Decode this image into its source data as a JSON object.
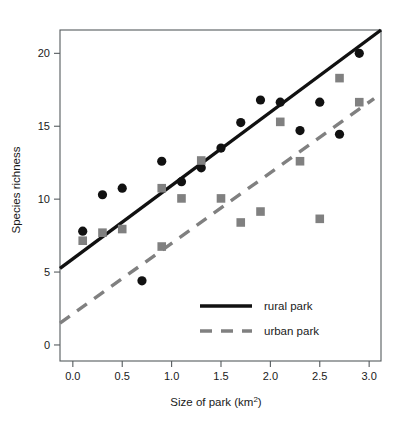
{
  "chart_data": {
    "type": "scatter",
    "title": "",
    "xlabel": "Size of park (km2)",
    "xlabel_base": "Size of park (km",
    "xlabel_sup": "2",
    "xlabel_close": ")",
    "ylabel": "Species richness",
    "xlim": [
      -0.13,
      3.12
    ],
    "ylim": [
      -1.1,
      21.6
    ],
    "xticks": [
      0.0,
      0.5,
      1.0,
      1.5,
      2.0,
      2.5,
      3.0
    ],
    "xticklabels": [
      "0.0",
      "0.5",
      "1.0",
      "1.5",
      "2.0",
      "2.5",
      "3.0"
    ],
    "yticks": [
      0,
      5,
      10,
      15,
      20
    ],
    "yticklabels": [
      "0",
      "5",
      "10",
      "15",
      "20"
    ],
    "grid": false,
    "legend_position": "lower-right-inside",
    "series": [
      {
        "name": "rural park",
        "marker": "circle",
        "color": "#111111",
        "linestyle": "solid",
        "linewidth": 3.4,
        "points": [
          {
            "x": 0.1,
            "y": 7.8
          },
          {
            "x": 0.3,
            "y": 10.3
          },
          {
            "x": 0.5,
            "y": 10.75
          },
          {
            "x": 0.7,
            "y": 4.4
          },
          {
            "x": 0.9,
            "y": 12.6
          },
          {
            "x": 1.1,
            "y": 11.2
          },
          {
            "x": 1.3,
            "y": 12.15
          },
          {
            "x": 1.5,
            "y": 13.5
          },
          {
            "x": 1.7,
            "y": 15.25
          },
          {
            "x": 1.9,
            "y": 16.8
          },
          {
            "x": 2.1,
            "y": 16.65
          },
          {
            "x": 2.3,
            "y": 14.7
          },
          {
            "x": 2.5,
            "y": 16.65
          },
          {
            "x": 2.7,
            "y": 14.45
          },
          {
            "x": 2.9,
            "y": 20.0
          }
        ],
        "fit_line": {
          "x1": -0.13,
          "y1": 5.25,
          "x2": 3.12,
          "y2": 21.6
        }
      },
      {
        "name": "urban park",
        "marker": "square",
        "color": "#808080",
        "linestyle": "dashed",
        "linewidth": 3.4,
        "points": [
          {
            "x": 0.1,
            "y": 7.15
          },
          {
            "x": 0.3,
            "y": 7.7
          },
          {
            "x": 0.5,
            "y": 7.95
          },
          {
            "x": 0.9,
            "y": 6.75
          },
          {
            "x": 0.9,
            "y": 10.75
          },
          {
            "x": 1.1,
            "y": 10.05
          },
          {
            "x": 1.3,
            "y": 12.65
          },
          {
            "x": 1.5,
            "y": 10.05
          },
          {
            "x": 1.7,
            "y": 8.4
          },
          {
            "x": 1.9,
            "y": 9.15
          },
          {
            "x": 2.1,
            "y": 15.3
          },
          {
            "x": 2.3,
            "y": 12.6
          },
          {
            "x": 2.5,
            "y": 8.65
          },
          {
            "x": 2.7,
            "y": 18.3
          },
          {
            "x": 2.9,
            "y": 16.65
          }
        ],
        "fit_line": {
          "x1": -0.13,
          "y1": 1.5,
          "x2": 3.05,
          "y2": 16.9
        }
      }
    ]
  },
  "legend": {
    "entries": [
      {
        "label": "rural park",
        "color": "#111111",
        "style": "solid"
      },
      {
        "label": "urban park",
        "color": "#808080",
        "style": "dashed"
      }
    ]
  }
}
